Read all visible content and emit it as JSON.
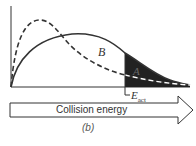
{
  "figure": {
    "label_b_curve": "B",
    "label_a_region": "A",
    "threshold_label": "E",
    "threshold_sub": "act",
    "arrow_label": "Collision energy",
    "caption": "(b)"
  },
  "colors": {
    "line": "#333333",
    "shade": "#222222",
    "background": "#ffffff"
  }
}
